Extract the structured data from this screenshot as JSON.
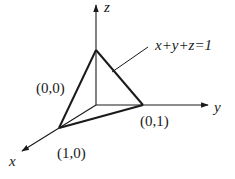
{
  "diagram": {
    "type": "3d-coordinate-plane",
    "axes": {
      "x": {
        "label": "x"
      },
      "y": {
        "label": "y"
      },
      "z": {
        "label": "z"
      }
    },
    "plane_label": "x+y+z=1",
    "vertex_labels": {
      "z_vertex": "(0,0)",
      "y_vertex": "(0,1)",
      "x_vertex": "(1,0)"
    },
    "colors": {
      "stroke": "#1a1a1a",
      "background": "#ffffff"
    }
  }
}
